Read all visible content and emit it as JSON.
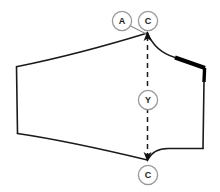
{
  "figure": {
    "background_color": "#ffffff",
    "outline_color": "#1a1a1a",
    "emphasis_color": "#000000",
    "callout_stroke_color": "#9a9a9a",
    "grainline": {
      "label": "Y",
      "style": "dashed",
      "arrow_top": true,
      "arrow_bottom": true
    },
    "callouts": [
      {
        "id": "callout-a-top",
        "label": "A",
        "cx": 122,
        "cy": 21,
        "r": 10
      },
      {
        "id": "callout-c-top",
        "label": "C",
        "cx": 148,
        "cy": 21,
        "r": 10
      },
      {
        "id": "callout-y-center",
        "label": "Y",
        "cx": 148,
        "cy": 100,
        "r": 10
      },
      {
        "id": "callout-c-bottom",
        "label": "C",
        "cx": 148,
        "cy": 175,
        "r": 10
      }
    ],
    "notes": {
      "emphasis_segment": "upper-right-edge",
      "shape": "curved quadrilateral panel"
    }
  }
}
